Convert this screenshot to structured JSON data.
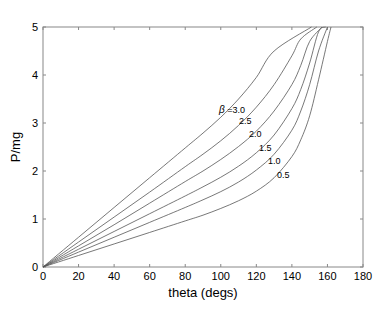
{
  "chart_data": {
    "type": "line",
    "title": "",
    "xlabel": "theta (degs)",
    "ylabel": "P/mg",
    "xlim": [
      0,
      180
    ],
    "ylim": [
      0,
      5
    ],
    "xticks": [
      0,
      20,
      40,
      60,
      80,
      100,
      120,
      140,
      160,
      180
    ],
    "yticks": [
      0,
      1,
      2,
      3,
      4,
      5
    ],
    "grid": false,
    "legend": "inline curve labels",
    "x": [
      0,
      20,
      40,
      60,
      80,
      90,
      100,
      110,
      120,
      130,
      140,
      145,
      150,
      155,
      160,
      165
    ],
    "series": [
      {
        "name": "β =3.0",
        "label": "β =3.0",
        "values": [
          0,
          0.62,
          1.24,
          1.86,
          2.48,
          2.79,
          3.12,
          3.5,
          3.95,
          4.5,
          5.0,
          null,
          null,
          null,
          null,
          null
        ]
      },
      {
        "name": "2.5",
        "label": "2.5",
        "values": [
          0,
          0.52,
          1.04,
          1.56,
          2.09,
          2.35,
          2.63,
          2.95,
          3.33,
          3.8,
          4.4,
          4.75,
          5.0,
          null,
          null,
          null
        ]
      },
      {
        "name": "2.0",
        "label": "2.0",
        "values": [
          0,
          0.44,
          0.88,
          1.33,
          1.78,
          2.0,
          2.24,
          2.51,
          2.83,
          3.25,
          3.8,
          4.2,
          4.7,
          5.0,
          null,
          null
        ]
      },
      {
        "name": "1.5",
        "label": "1.5",
        "values": [
          0,
          0.37,
          0.74,
          1.11,
          1.48,
          1.67,
          1.87,
          2.1,
          2.38,
          2.75,
          3.3,
          3.7,
          4.25,
          4.9,
          5.0,
          null
        ]
      },
      {
        "name": "1.0",
        "label": "1.0",
        "values": [
          0,
          0.31,
          0.62,
          0.93,
          1.24,
          1.4,
          1.57,
          1.77,
          2.02,
          2.35,
          2.85,
          3.25,
          3.8,
          4.5,
          5.0,
          null
        ]
      },
      {
        "name": "0.5",
        "label": "0.5",
        "values": [
          0,
          0.24,
          0.48,
          0.72,
          0.96,
          1.08,
          1.22,
          1.38,
          1.58,
          1.86,
          2.3,
          2.65,
          3.15,
          3.9,
          4.7,
          5.0
        ]
      }
    ],
    "top_crossings_deg": [
      151,
      154,
      157,
      159,
      160,
      162
    ]
  }
}
